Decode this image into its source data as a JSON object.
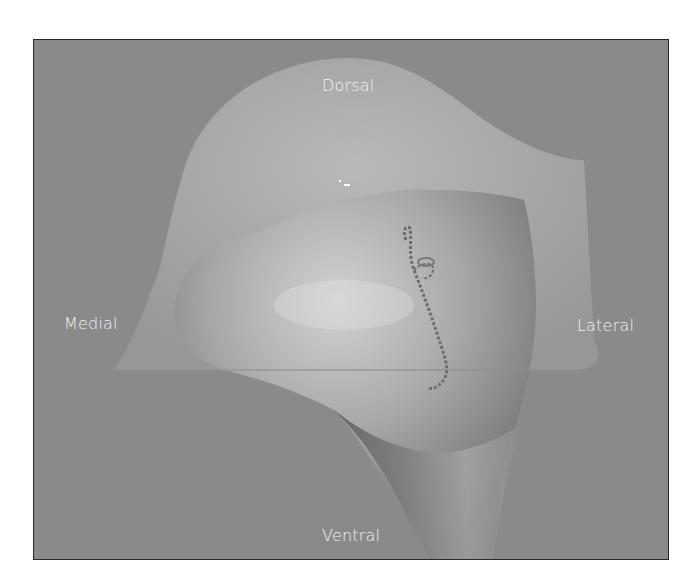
{
  "figure": {
    "labels": {
      "top": "Dorsal",
      "left": "Medial",
      "right": "Lateral",
      "bottom": "Ventral"
    },
    "colors": {
      "background": "#8a8a8a",
      "translucent_sheet": "#a8a8a8",
      "solid_body": "#9c9c9c",
      "label_text": "#f2f2f2",
      "frame_border": "#2a2a2a"
    }
  }
}
